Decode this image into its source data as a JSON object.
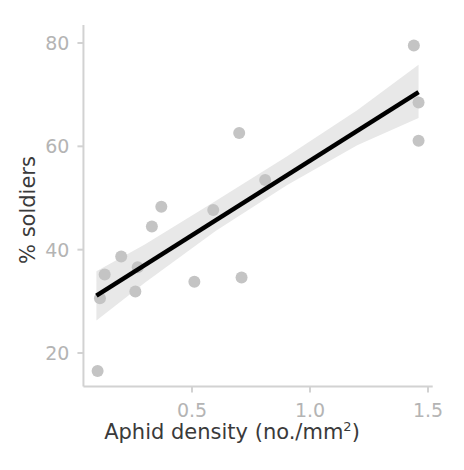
{
  "chart_data": {
    "type": "scatter",
    "title": "",
    "xlabel": "Aphid density (no./mm2)",
    "xlabel_base": "Aphid density (no./mm",
    "xlabel_sup": "2",
    "xlabel_tail": ")",
    "ylabel": "% soldiers",
    "xlim": [
      0.04,
      1.52
    ],
    "ylim": [
      13.5,
      83.5
    ],
    "xticks": [
      0.5,
      1.0,
      1.5
    ],
    "xtick_labels": [
      "0.5",
      "1.0",
      "1.5"
    ],
    "yticks": [
      20,
      40,
      60,
      80
    ],
    "ytick_labels": [
      "20",
      "40",
      "60",
      "80"
    ],
    "grid": false,
    "legend": "none",
    "point_color": "#c4c4c4",
    "line_color": "#000000",
    "band_color": "#e8e8e8",
    "axis_color": "#d2d2d2",
    "tick_label_color": "#b4b4b4",
    "axis_title_color": "#3a3a3a",
    "points": [
      {
        "x": 0.1,
        "y": 16.5
      },
      {
        "x": 0.11,
        "y": 30.6
      },
      {
        "x": 0.13,
        "y": 35.2
      },
      {
        "x": 0.2,
        "y": 38.7
      },
      {
        "x": 0.26,
        "y": 31.9
      },
      {
        "x": 0.27,
        "y": 36.6
      },
      {
        "x": 0.33,
        "y": 44.5
      },
      {
        "x": 0.37,
        "y": 48.3
      },
      {
        "x": 0.51,
        "y": 33.8
      },
      {
        "x": 0.59,
        "y": 47.7
      },
      {
        "x": 0.7,
        "y": 62.6
      },
      {
        "x": 0.71,
        "y": 34.6
      },
      {
        "x": 0.81,
        "y": 53.5
      },
      {
        "x": 1.44,
        "y": 79.5
      },
      {
        "x": 1.46,
        "y": 68.5
      },
      {
        "x": 1.46,
        "y": 61.1
      }
    ],
    "fit_line": {
      "type": "linear-regression",
      "x_start": 0.095,
      "y_start": 31.1,
      "x_end": 1.46,
      "y_end": 70.5
    },
    "confidence_band": {
      "label": "95% confidence interval",
      "upper": [
        {
          "x": 0.095,
          "y": 35.8
        },
        {
          "x": 0.3,
          "y": 41.0
        },
        {
          "x": 0.6,
          "y": 49.4
        },
        {
          "x": 0.9,
          "y": 58.0
        },
        {
          "x": 1.2,
          "y": 67.0
        },
        {
          "x": 1.46,
          "y": 75.8
        }
      ],
      "lower": [
        {
          "x": 0.095,
          "y": 26.3
        },
        {
          "x": 0.3,
          "y": 33.6
        },
        {
          "x": 0.6,
          "y": 43.6
        },
        {
          "x": 0.9,
          "y": 52.4
        },
        {
          "x": 1.2,
          "y": 60.2
        },
        {
          "x": 1.46,
          "y": 65.5
        }
      ]
    }
  }
}
